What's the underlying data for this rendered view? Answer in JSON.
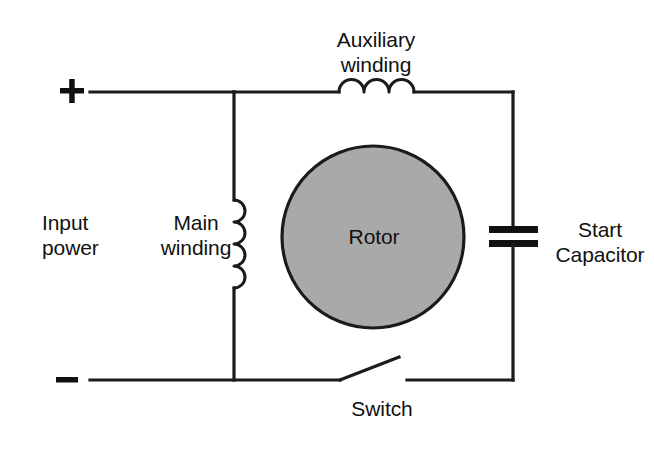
{
  "diagram": {
    "labels": {
      "auxiliary_winding": "Auxiliary\nwinding",
      "input_power": "Input\npower",
      "main_winding": "Main\nwinding",
      "rotor": "Rotor",
      "start_capacitor": "Start\nCapacitor",
      "switch": "Switch"
    },
    "terminals": {
      "positive": "+",
      "negative": "–"
    },
    "colors": {
      "background": "#ffffff",
      "wire": "#1b1b1b",
      "text": "#111111",
      "rotor_fill": "#a9a9a9",
      "rotor_stroke": "#1b1b1b",
      "capacitor_plate": "#111111"
    },
    "components": [
      {
        "name": "auxiliary-winding-inductor",
        "type": "inductor",
        "orientation": "horizontal",
        "coils": 3
      },
      {
        "name": "main-winding-inductor",
        "type": "inductor",
        "orientation": "vertical",
        "coils": 4
      },
      {
        "name": "rotor",
        "type": "rotor",
        "shape": "circle"
      },
      {
        "name": "start-capacitor",
        "type": "capacitor",
        "plates": 2
      },
      {
        "name": "centrifugal-switch",
        "type": "switch",
        "state": "open"
      }
    ]
  }
}
